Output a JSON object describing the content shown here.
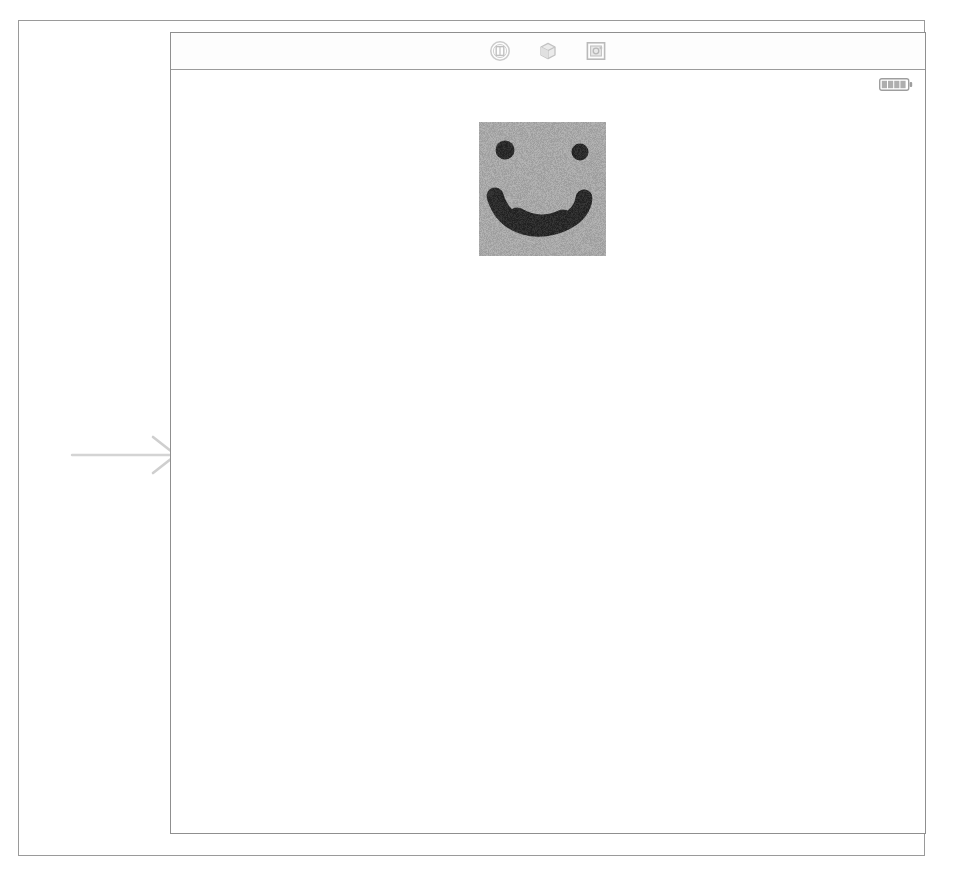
{
  "document": {
    "kind": "scanned-page",
    "border_color": "#9a9a9a",
    "background_color": "#ffffff"
  },
  "annotation": {
    "arrow": {
      "name": "pointer-arrow",
      "direction": "right",
      "color": "#d2d2d2",
      "label": ""
    }
  },
  "window": {
    "title": "",
    "border_color": "#8f8f8f",
    "background_color": "#ffffff",
    "toolbar": {
      "buttons": [
        {
          "icon": "camera-icon",
          "label": "",
          "tooltip": "Camera"
        },
        {
          "icon": "cube-icon",
          "label": "",
          "tooltip": "3D View"
        },
        {
          "icon": "crop-frame-icon",
          "label": "",
          "tooltip": "Crop"
        }
      ]
    },
    "status_strip": {
      "battery": {
        "icon": "battery-icon",
        "level_text": "",
        "segments": 4,
        "color": "#6f6f6f"
      }
    },
    "canvas": {
      "items": [
        {
          "name": "smiley-face-image",
          "type": "raster-image",
          "alt_text": "Hand-drawn smiley face on gray background",
          "background_color": "#a8a8a8",
          "ink_color": "#2b2b2b",
          "width": 127,
          "height": 134
        }
      ]
    }
  }
}
